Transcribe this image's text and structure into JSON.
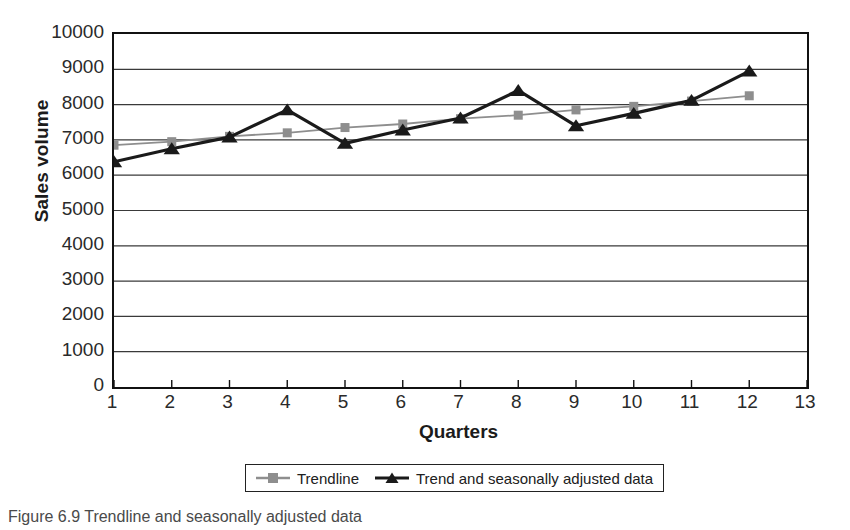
{
  "chart_data": {
    "type": "line",
    "title": "",
    "xlabel": "Quarters",
    "ylabel": "Sales volume",
    "x": [
      1,
      2,
      3,
      4,
      5,
      6,
      7,
      8,
      9,
      10,
      11,
      12
    ],
    "xlim": [
      1,
      13
    ],
    "ylim": [
      0,
      10000
    ],
    "xticks": [
      "1",
      "2",
      "3",
      "4",
      "5",
      "6",
      "7",
      "8",
      "9",
      "10",
      "11",
      "12",
      "13"
    ],
    "yticks": [
      "0",
      "1000",
      "2000",
      "3000",
      "4000",
      "5000",
      "6000",
      "7000",
      "8000",
      "9000",
      "10000"
    ],
    "grid": "horizontal",
    "legend_position": "bottom",
    "series": [
      {
        "name": "Trendline",
        "color": "#8e8e8e",
        "marker": "square",
        "values": [
          6850,
          6950,
          7100,
          7200,
          7350,
          7450,
          7600,
          7700,
          7850,
          7950,
          8100,
          8250
        ]
      },
      {
        "name": "Trend and seasonally adjusted data",
        "color": "#1a1a1a",
        "marker": "triangle",
        "values": [
          6380,
          6750,
          7080,
          7850,
          6900,
          7280,
          7620,
          8400,
          7400,
          7750,
          8120,
          8950
        ]
      }
    ]
  },
  "figure": {
    "caption": "Figure 6.9 Trendline and seasonally adjusted data"
  }
}
